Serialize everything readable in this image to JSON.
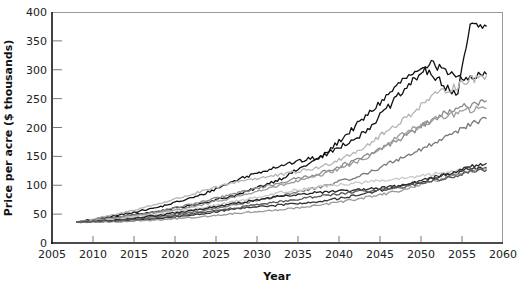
{
  "chart_data": {
    "type": "line",
    "title": "",
    "xlabel": "Year",
    "ylabel": "Price per acre ($ thousands)",
    "xlim": [
      2005,
      2060
    ],
    "ylim": [
      0,
      400
    ],
    "grid": false,
    "legend": "none",
    "x_ticks": [
      "2005",
      "2010",
      "2015",
      "2020",
      "2025",
      "2030",
      "2035",
      "2040",
      "2045",
      "2050",
      "2055",
      "2060"
    ],
    "y_ticks": [
      "0",
      "50",
      "100",
      "150",
      "200",
      "250",
      "300",
      "350",
      "400"
    ],
    "x": [
      2008,
      2013,
      2018,
      2023,
      2028,
      2033,
      2038,
      2043,
      2048,
      2051,
      2053,
      2054.5,
      2055,
      2056,
      2058
    ],
    "series": [
      {
        "name": "run-1",
        "color": "#111111",
        "values": [
          36,
          45,
          55,
          68,
          85,
          112,
          150,
          215,
          285,
          300,
          270,
          255,
          300,
          375,
          375
        ]
      },
      {
        "name": "run-2",
        "color": "#111111",
        "values": [
          36,
          48,
          62,
          82,
          112,
          135,
          150,
          190,
          265,
          310,
          300,
          290,
          280,
          285,
          292
        ]
      },
      {
        "name": "run-3",
        "color": "#b5b5b5",
        "values": [
          36,
          50,
          68,
          88,
          108,
          118,
          132,
          165,
          215,
          250,
          265,
          272,
          278,
          282,
          290
        ]
      },
      {
        "name": "run-4",
        "color": "#8a8a8a",
        "values": [
          36,
          44,
          55,
          70,
          88,
          105,
          122,
          148,
          185,
          210,
          225,
          230,
          235,
          240,
          247
        ]
      },
      {
        "name": "run-5",
        "color": "#9a9a9a",
        "values": [
          36,
          42,
          52,
          65,
          82,
          100,
          118,
          145,
          190,
          210,
          220,
          225,
          228,
          230,
          233
        ]
      },
      {
        "name": "run-6",
        "color": "#777777",
        "values": [
          36,
          40,
          46,
          55,
          68,
          82,
          98,
          118,
          150,
          168,
          185,
          195,
          200,
          205,
          215
        ]
      },
      {
        "name": "run-7",
        "color": "#c8c8c8",
        "values": [
          36,
          42,
          50,
          60,
          74,
          88,
          98,
          105,
          112,
          118,
          122,
          126,
          128,
          130,
          132
        ]
      },
      {
        "name": "run-8",
        "color": "#222222",
        "values": [
          36,
          40,
          48,
          58,
          70,
          82,
          88,
          92,
          100,
          110,
          118,
          125,
          128,
          132,
          138
        ]
      },
      {
        "name": "run-9",
        "color": "#333333",
        "values": [
          36,
          38,
          42,
          50,
          60,
          66,
          72,
          85,
          100,
          112,
          118,
          122,
          126,
          128,
          130
        ]
      },
      {
        "name": "run-10",
        "color": "#999999",
        "values": [
          36,
          37,
          40,
          45,
          52,
          58,
          66,
          78,
          92,
          105,
          112,
          118,
          122,
          125,
          128
        ]
      },
      {
        "name": "run-11",
        "color": "#555555",
        "values": [
          36,
          39,
          44,
          52,
          62,
          72,
          82,
          90,
          98,
          106,
          112,
          116,
          120,
          124,
          127
        ]
      }
    ]
  }
}
